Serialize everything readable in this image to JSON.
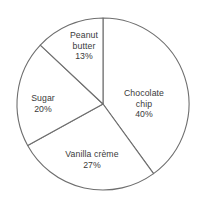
{
  "chart_data": {
    "type": "pie",
    "title": "",
    "subtitle": "",
    "xlabel": "",
    "ylabel": "",
    "legend": "none",
    "grid": false,
    "start_angle_deg": 0,
    "direction": "clockwise",
    "categories": [
      "Chocolate chip",
      "Vanilla crème",
      "Sugar",
      "Peanut butter"
    ],
    "values": [
      40,
      27,
      20,
      13
    ],
    "units": "percent",
    "slices": [
      {
        "id": "chocolate",
        "label_lines": [
          "Chocolate",
          "chip",
          "40%"
        ],
        "name": "Chocolate chip",
        "value": 40,
        "value_text": "40%",
        "fill": "#ffffff",
        "stroke": "#6e6e6e"
      },
      {
        "id": "vanilla",
        "label_lines": [
          "Vanilla crème",
          "27%"
        ],
        "name": "Vanilla crème",
        "value": 27,
        "value_text": "27%",
        "fill": "#ffffff",
        "stroke": "#6e6e6e"
      },
      {
        "id": "sugar",
        "label_lines": [
          "Sugar",
          "20%"
        ],
        "name": "Sugar",
        "value": 20,
        "value_text": "20%",
        "fill": "#ffffff",
        "stroke": "#6e6e6e"
      },
      {
        "id": "peanut",
        "label_lines": [
          "Peanut",
          "butter",
          "13%"
        ],
        "name": "Peanut butter",
        "value": 13,
        "value_text": "13%",
        "fill": "#ffffff",
        "stroke": "#6e6e6e"
      }
    ],
    "geometry": {
      "center_x": 103,
      "center_y": 104,
      "radius": 86
    },
    "colors": {
      "background": "#ffffff",
      "outline": "#6e6e6e",
      "text": "#3a3a3a"
    }
  }
}
